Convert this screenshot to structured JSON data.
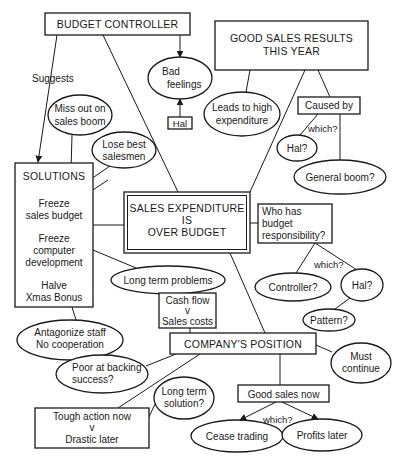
{
  "diagram": {
    "nodes": {
      "budget_controller": {
        "lines": [
          "BUDGET CONTROLLER"
        ]
      },
      "bad_feelings": {
        "lines": [
          "Bad",
          "feelings"
        ]
      },
      "hal_top": {
        "lines": [
          "Hal"
        ]
      },
      "good_sales_results": {
        "lines": [
          "GOOD SALES RESULTS",
          "THIS YEAR"
        ]
      },
      "miss_out": {
        "lines": [
          "Miss out on",
          "sales boom"
        ]
      },
      "lose_best": {
        "lines": [
          "Lose best",
          "salesmen"
        ]
      },
      "leads_to_high": {
        "lines": [
          "Leads to high",
          "expenditure"
        ]
      },
      "caused_by": {
        "lines": [
          "Caused by"
        ]
      },
      "hal_q_top": {
        "lines": [
          "Hal?"
        ]
      },
      "general_boom": {
        "lines": [
          "General boom?"
        ]
      },
      "solutions": {
        "title": "SOLUTIONS",
        "items": [
          [
            "Freeze",
            "sales budget"
          ],
          [
            "Freeze",
            "computer",
            "development"
          ],
          [
            "Halve",
            "Xmas Bonus"
          ]
        ]
      },
      "sales_expenditure": {
        "lines": [
          "SALES EXPENDITURE",
          "IS",
          "OVER BUDGET"
        ]
      },
      "who_has": {
        "lines": [
          "Who has",
          "budget",
          "responsibility?"
        ]
      },
      "long_term_problems": {
        "lines": [
          "Long term problems"
        ]
      },
      "controller_q": {
        "lines": [
          "Controller?"
        ]
      },
      "hal_q_right": {
        "lines": [
          "Hal?"
        ]
      },
      "pattern_q": {
        "lines": [
          "Pattern?"
        ]
      },
      "cash_flow": {
        "lines": [
          "Cash flow",
          "v",
          "Sales costs"
        ]
      },
      "companys_position": {
        "lines": [
          "COMPANY'S POSITION"
        ]
      },
      "antagonize": {
        "lines": [
          "Antagonize staff",
          "No cooperation"
        ]
      },
      "must_continue": {
        "lines": [
          "Must",
          "continue"
        ]
      },
      "poor_backing": {
        "lines": [
          "Poor at backing",
          "success?"
        ]
      },
      "long_term_solution": {
        "lines": [
          "Long term",
          "solution?"
        ]
      },
      "tough_action": {
        "lines": [
          "Tough action now",
          "v",
          "Drastic later"
        ]
      },
      "good_sales_now": {
        "lines": [
          "Good sales now"
        ]
      },
      "cease_trading": {
        "lines": [
          "Cease trading"
        ]
      },
      "profits_later": {
        "lines": [
          "Profits later"
        ]
      }
    },
    "edge_labels": {
      "suggests": "Suggests",
      "which_caused": "which?",
      "which_responsibility": "which?",
      "which_good_sales": "which?"
    },
    "colors": {
      "ink": "#1a1a1a",
      "background": "#ffffff"
    }
  }
}
